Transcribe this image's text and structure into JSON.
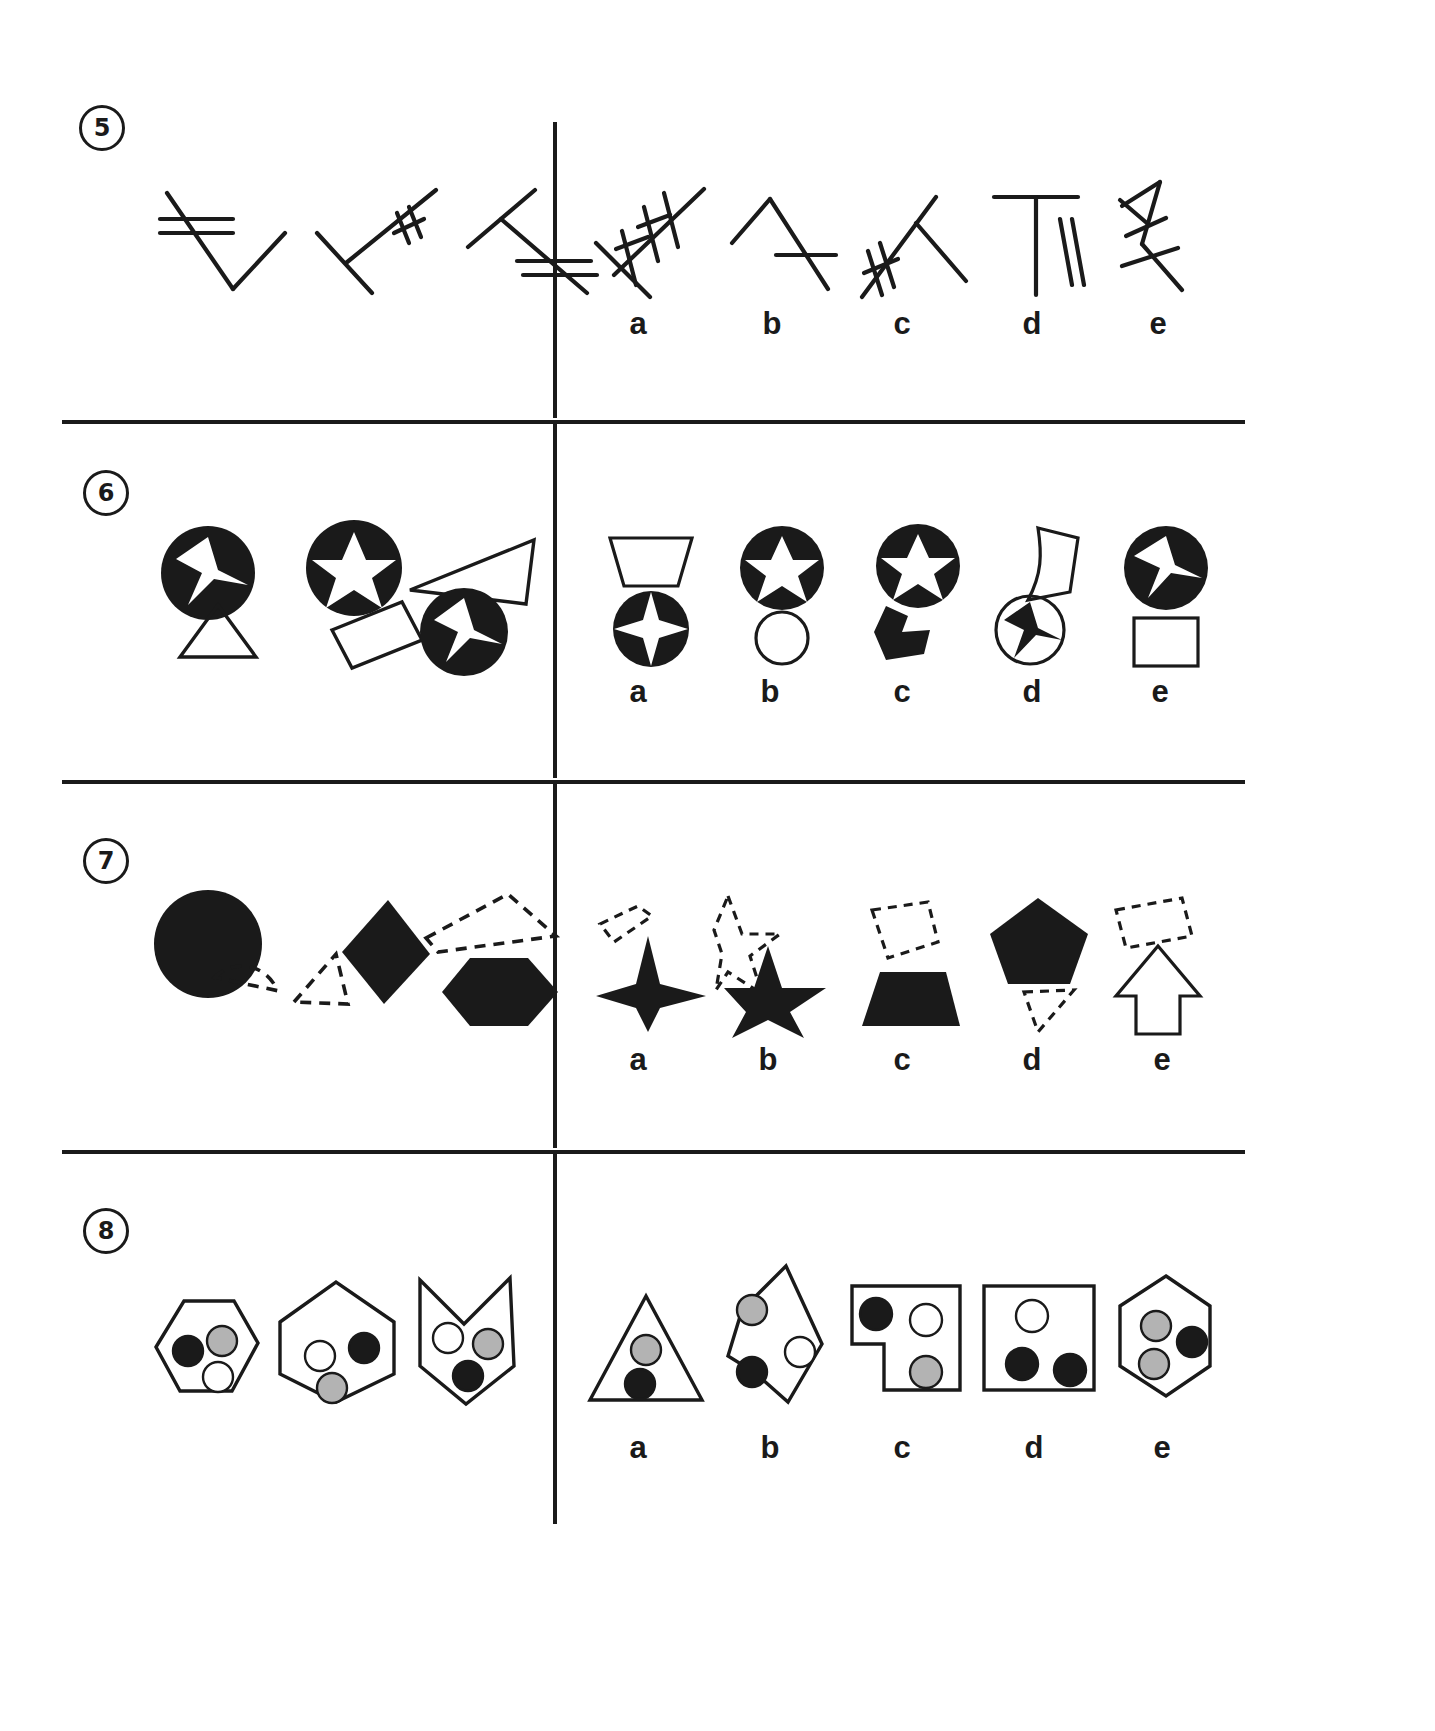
{
  "document": {
    "type": "visual-reasoning-test",
    "page_background": "#ffffff",
    "ink_color": "#1a1a1a",
    "gray_fill": "#b3b3b3",
    "white_fill": "#ffffff"
  },
  "layout": {
    "width": 1435,
    "height": 1731,
    "divider_x": 553,
    "row_rules_y": [
      420,
      780,
      1150
    ],
    "left_panel": "stimulus",
    "right_panel": "answer-options"
  },
  "option_letters": [
    "a",
    "b",
    "c",
    "d",
    "e"
  ],
  "questions": [
    {
      "number": "5",
      "badge": "5",
      "theme": "line-segments-with-tick-marks",
      "stimulus": [
        {
          "name": "line-figure-1",
          "ticks": 2,
          "description": "bent line with two parallel tick marks on upper arm"
        },
        {
          "name": "line-figure-2",
          "ticks": 2,
          "description": "bent line with two slanted tick marks on upper right arm"
        },
        {
          "name": "line-figure-3",
          "ticks": 2,
          "description": "bent line with two parallel tick marks on lower right arm"
        }
      ],
      "options": [
        {
          "letter": "a",
          "name": "option-a-lines",
          "ticks": 4,
          "description": "crossed lines with four tick marks"
        },
        {
          "letter": "b",
          "name": "option-b-lines",
          "ticks": 1,
          "description": "bent line with single horizontal tick"
        },
        {
          "letter": "c",
          "name": "option-c-lines",
          "ticks": 2,
          "description": "bent line with two tick marks on left arm"
        },
        {
          "letter": "d",
          "name": "option-d-lines",
          "ticks": 2,
          "description": "T shape with two vertical ticks"
        },
        {
          "letter": "e",
          "name": "option-e-lines",
          "ticks": 3,
          "description": "zigzag line with three tick marks"
        }
      ]
    },
    {
      "number": "6",
      "badge": "6",
      "theme": "filled-circles-with-white-stars-and-outline-polygons",
      "stimulus": [
        {
          "name": "stimulus-1",
          "description": "black circle with white 3-point star above outline triangle"
        },
        {
          "name": "stimulus-2",
          "description": "black circle with white 5-point star above outline rectangle"
        },
        {
          "name": "stimulus-3",
          "description": "outline triangle above black circle with white 3-point star"
        }
      ],
      "options": [
        {
          "letter": "a",
          "name": "option-a",
          "description": "outline trapezoid above black circle with white 4-point star"
        },
        {
          "letter": "b",
          "name": "option-b",
          "description": "black circle with white 5-point star above outline circle"
        },
        {
          "letter": "c",
          "name": "option-c",
          "description": "black circle with white 5-point star above black arrow polygon"
        },
        {
          "letter": "d",
          "name": "option-d",
          "description": "outline curved quadrilateral above outline circle with black 3-point star"
        },
        {
          "letter": "e",
          "name": "option-e",
          "description": "black circle with white 3-point star above outline square"
        }
      ]
    },
    {
      "number": "7",
      "badge": "7",
      "theme": "solid-black-shapes-paired-with-dashed-outline-shapes",
      "stimulus": [
        {
          "name": "stimulus-1",
          "description": "solid black circle with dashed semicircle below right"
        },
        {
          "name": "stimulus-2",
          "description": "solid black diamond with dashed triangle to lower left"
        },
        {
          "name": "stimulus-3",
          "description": "dashed quadrilateral above solid black hexagon"
        }
      ],
      "options": [
        {
          "letter": "a",
          "name": "option-a",
          "description": "small dashed quadrilateral above solid black 4-point star"
        },
        {
          "letter": "b",
          "name": "option-b",
          "description": "dashed star outline overlapping solid black 5-point star"
        },
        {
          "letter": "c",
          "name": "option-c",
          "description": "dashed quadrilateral above solid black trapezoid"
        },
        {
          "letter": "d",
          "name": "option-d",
          "description": "solid black pentagon above dashed triangle"
        },
        {
          "letter": "e",
          "name": "option-e",
          "description": "dashed quadrilateral above outline arrow"
        }
      ]
    },
    {
      "number": "8",
      "badge": "8",
      "theme": "outline-polygons-containing-three-dots",
      "dot_colors": [
        "black",
        "gray",
        "white"
      ],
      "stimulus": [
        {
          "name": "stimulus-1",
          "description": "hexagon containing black, gray and white dots"
        },
        {
          "name": "stimulus-2",
          "description": "hexagon containing white, black and gray dots"
        },
        {
          "name": "stimulus-3",
          "description": "notched pentagon containing white, gray and black dots"
        }
      ],
      "options": [
        {
          "letter": "a",
          "name": "option-a",
          "description": "triangle containing gray and black dots"
        },
        {
          "letter": "b",
          "name": "option-b",
          "description": "irregular pentagon with gray, white and black dots on edge"
        },
        {
          "letter": "c",
          "name": "option-c",
          "description": "L-shaped polygon with black, white and gray dots"
        },
        {
          "letter": "d",
          "name": "option-d",
          "description": "square with white, black and black dots"
        },
        {
          "letter": "e",
          "name": "option-e",
          "description": "hexagon containing gray, gray and black dots"
        }
      ]
    }
  ]
}
